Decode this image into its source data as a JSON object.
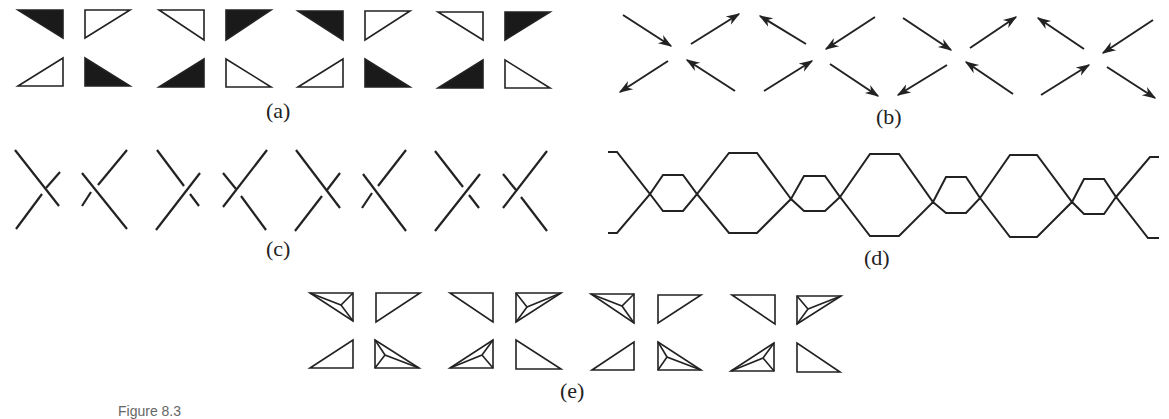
{
  "figure": {
    "panels": [
      {
        "id": "a",
        "label": "(a)",
        "description": "Four blocks of 2x2 right triangles, alternating black-filled and outlined"
      },
      {
        "id": "b",
        "label": "(b)",
        "description": "Four X-shaped arrow crossings with alternating in/out directions"
      },
      {
        "id": "c",
        "label": "(c)",
        "description": "Eight knot-diagram crossings with alternating over/under strands"
      },
      {
        "id": "d",
        "label": "(d)",
        "description": "Braided two-strand chain with alternating large and small hexagonal loops"
      },
      {
        "id": "e",
        "label": "(e)",
        "description": "Four blocks of 2x2 triangles, some subdivided into three sub-triangles from an interior point"
      }
    ],
    "caption_partial": "Figure 8.3"
  },
  "colors": {
    "stroke": "#222222",
    "fill_dark": "#1a1a1a",
    "background": "#ffffff"
  }
}
